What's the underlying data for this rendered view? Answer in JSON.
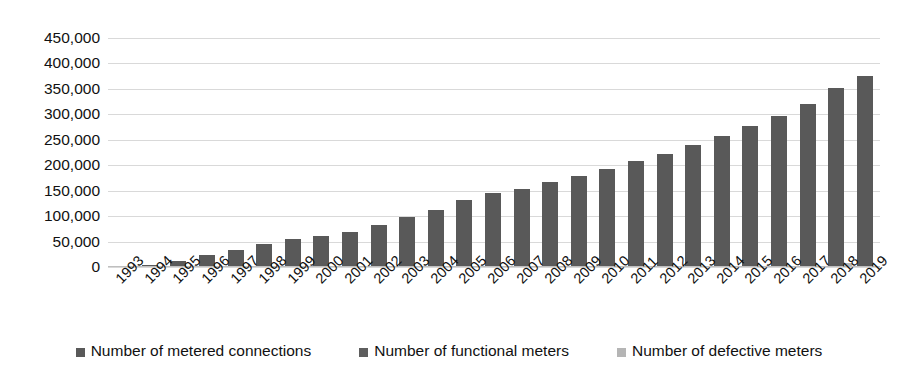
{
  "chart_data": {
    "type": "bar",
    "title": "",
    "subtitle": "",
    "xlabel": "",
    "ylabel": "",
    "ylim": [
      0,
      450000
    ],
    "ytick_labels": [
      "450,000",
      "400,000",
      "350,000",
      "300,000",
      "250,000",
      "200,000",
      "150,000",
      "100,000",
      "50,000",
      "0"
    ],
    "ytick_values": [
      450000,
      400000,
      350000,
      300000,
      250000,
      200000,
      150000,
      100000,
      50000,
      0
    ],
    "grid": true,
    "legend_position": "bottom",
    "categories": [
      "1993",
      "1994",
      "1995",
      "1996",
      "1997",
      "1998",
      "1999",
      "2000",
      "2001",
      "2002",
      "2003",
      "2004",
      "2005",
      "2006",
      "2007",
      "2008",
      "2009",
      "2010",
      "2011",
      "2012",
      "2013",
      "2014",
      "2015",
      "2016",
      "2017",
      "2018",
      "2019"
    ],
    "series": [
      {
        "name": "Number of metered connections",
        "color": "#595959",
        "values": [
          1500,
          3000,
          11000,
          24000,
          33000,
          45000,
          55000,
          61000,
          68000,
          82000,
          99000,
          113000,
          131000,
          145000,
          154000,
          168000,
          179000,
          193000,
          208000,
          222000,
          240000,
          257000,
          277000,
          297000,
          320000,
          352000,
          375000
        ]
      },
      {
        "name": "Number of functional meters",
        "color": "#5e5e5e",
        "values": [
          0,
          0,
          0,
          0,
          0,
          0,
          0,
          0,
          0,
          0,
          0,
          0,
          0,
          0,
          0,
          0,
          0,
          0,
          0,
          0,
          0,
          0,
          0,
          0,
          0,
          0,
          0
        ]
      },
      {
        "name": "Number of defective meters",
        "color": "#b5b5b5",
        "values": [
          0,
          0,
          0,
          0,
          0,
          0,
          0,
          0,
          0,
          0,
          0,
          0,
          0,
          0,
          0,
          0,
          0,
          0,
          0,
          0,
          0,
          0,
          0,
          0,
          0,
          8000,
          0
        ]
      }
    ]
  },
  "legend": {
    "items": [
      {
        "label": "Number of metered connections",
        "color": "#595959"
      },
      {
        "label": "Number of functional meters",
        "color": "#5e5e5e"
      },
      {
        "label": "Number of defective meters",
        "color": "#b5b5b5"
      }
    ]
  }
}
